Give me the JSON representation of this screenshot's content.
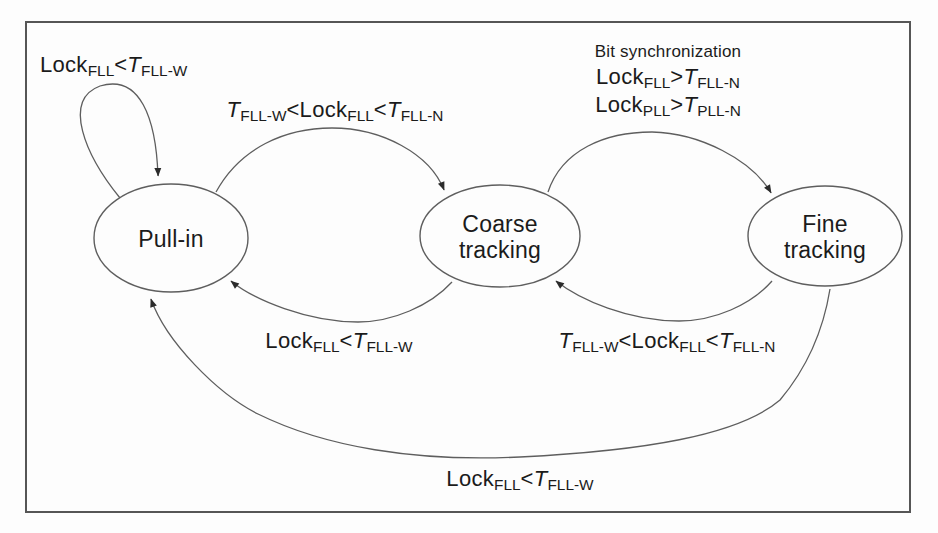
{
  "colors": {
    "background": "#fdfdfd",
    "frame": "#565656",
    "line": "#5e5e5e",
    "arrowhead": "#2b2b2b",
    "text": "#1b1b1b"
  },
  "states": [
    {
      "label": "Pull-in"
    },
    {
      "label": "Coarse tracking"
    },
    {
      "label": "Fine tracking"
    }
  ],
  "transitions": [
    {
      "name": "pull-in-self-loop",
      "from": "Pull-in",
      "to": "Pull-in",
      "label_segments": [
        {
          "t": "Lock"
        },
        {
          "t": "FLL",
          "sub": true
        },
        {
          "t": "<"
        },
        {
          "t": "T",
          "italic": true
        },
        {
          "t": "FLL-W",
          "sub": true
        }
      ]
    },
    {
      "name": "pull-in-to-coarse",
      "from": "Pull-in",
      "to": "Coarse tracking",
      "label_segments": [
        {
          "t": "T",
          "italic": true
        },
        {
          "t": "FLL-W",
          "sub": true
        },
        {
          "t": "<Lock"
        },
        {
          "t": "FLL",
          "sub": true
        },
        {
          "t": "<"
        },
        {
          "t": "T",
          "italic": true
        },
        {
          "t": "FLL-N",
          "sub": true
        }
      ]
    },
    {
      "name": "coarse-to-fine",
      "from": "Coarse tracking",
      "to": "Fine tracking",
      "heading": "Bit synchronization",
      "condition_lines": [
        [
          {
            "t": "Lock"
          },
          {
            "t": "FLL",
            "sub": true
          },
          {
            "t": ">"
          },
          {
            "t": "T",
            "italic": true
          },
          {
            "t": "FLL-N",
            "sub": true
          }
        ],
        [
          {
            "t": "Lock"
          },
          {
            "t": "PLL",
            "sub": true
          },
          {
            "t": ">"
          },
          {
            "t": "T",
            "italic": true
          },
          {
            "t": "PLL-N",
            "sub": true
          }
        ]
      ]
    },
    {
      "name": "coarse-to-pull-in",
      "from": "Coarse tracking",
      "to": "Pull-in",
      "label_segments": [
        {
          "t": "Lock"
        },
        {
          "t": "FLL",
          "sub": true
        },
        {
          "t": "<"
        },
        {
          "t": "T",
          "italic": true
        },
        {
          "t": "FLL-W",
          "sub": true
        }
      ]
    },
    {
      "name": "fine-to-coarse",
      "from": "Fine tracking",
      "to": "Coarse tracking",
      "label_segments": [
        {
          "t": "T",
          "italic": true
        },
        {
          "t": "FLL-W",
          "sub": true
        },
        {
          "t": "<Lock"
        },
        {
          "t": "FLL",
          "sub": true
        },
        {
          "t": "<"
        },
        {
          "t": "T",
          "italic": true
        },
        {
          "t": "FLL-N",
          "sub": true
        }
      ]
    },
    {
      "name": "fine-to-pull-in",
      "from": "Fine tracking",
      "to": "Pull-in",
      "label_segments": [
        {
          "t": "Lock"
        },
        {
          "t": "FLL",
          "sub": true
        },
        {
          "t": "<"
        },
        {
          "t": "T",
          "italic": true
        },
        {
          "t": "FLL-W",
          "sub": true
        }
      ]
    }
  ]
}
